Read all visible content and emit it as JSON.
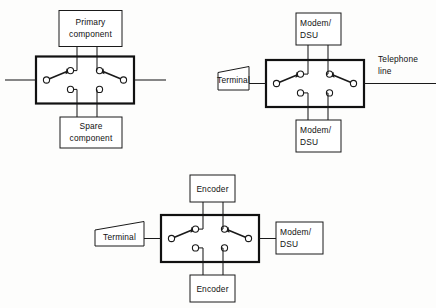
{
  "figure": {
    "background_color": "#fdfdfc",
    "line_color": "#1a1a1a",
    "diagram_type": "electrical-schematic",
    "diagrams": [
      {
        "id": "primary-spare-transfer-switch",
        "name": "Primary/spare component transfer switch",
        "top_box_label_line1": "Primary",
        "top_box_label_line2": "component",
        "bottom_box_label_line1": "Spare",
        "bottom_box_label_line2": "component",
        "left_terminal_label": "",
        "right_terminal_label": "",
        "has_left_lead": true,
        "has_right_lead": true
      },
      {
        "id": "modem-dsu-transfer-switch",
        "name": "Modem/DSU transfer switch with terminal and telephone line",
        "top_box_label_line1": "Modem/",
        "top_box_label_line2": "DSU",
        "bottom_box_label_line1": "Modem/",
        "bottom_box_label_line2": "DSU",
        "left_terminal_label": "Terminal",
        "right_label_line1": "Telephone",
        "right_label_line2": "line",
        "has_left_lead": true,
        "has_right_lead": true
      },
      {
        "id": "encoder-transfer-switch",
        "name": "Encoder transfer switch between terminal and modem/DSU",
        "top_box_label_line1": "Encoder",
        "top_box_label_line2": "",
        "bottom_box_label_line1": "Encoder",
        "bottom_box_label_line2": "",
        "left_terminal_label": "Terminal",
        "right_box_label_line1": "Modem/",
        "right_box_label_line2": "DSU",
        "has_left_lead": false,
        "has_right_lead": false
      }
    ]
  }
}
